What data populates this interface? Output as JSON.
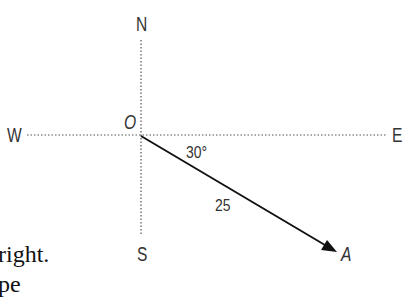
{
  "diagram": {
    "type": "bearing-vector",
    "compass": {
      "north": "N",
      "south": "S",
      "east": "E",
      "west": "W"
    },
    "origin_label": "O",
    "point_label": "A",
    "angle_label": "30°",
    "magnitude_label": "25",
    "angle_deg_below_east": 30,
    "magnitude": 25
  },
  "text_fragments": {
    "line1": "right.",
    "line2": "pe"
  }
}
